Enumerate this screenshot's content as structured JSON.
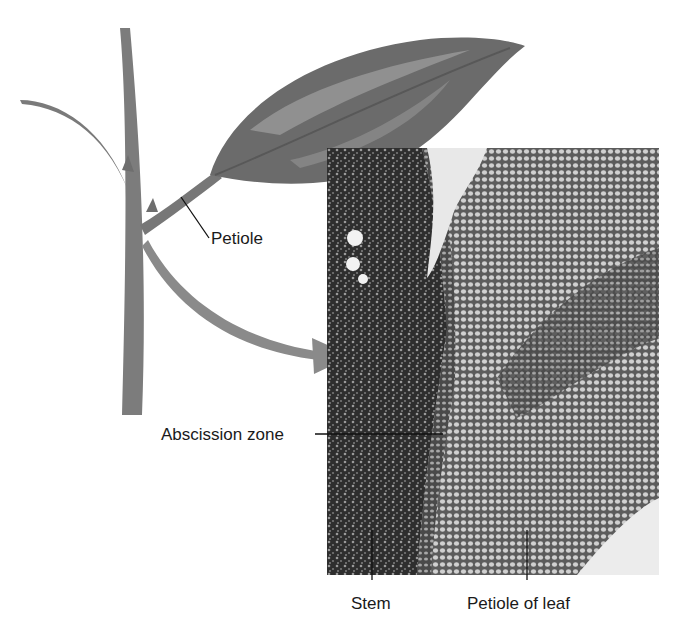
{
  "figure": {
    "labels": {
      "petiole": "Petiole",
      "abscission_zone": "Abscission zone",
      "stem": "Stem",
      "petiole_of_leaf": "Petiole of leaf"
    },
    "colors": {
      "stem": "#7a7a7a",
      "leaf_dark": "#6b6b6b",
      "leaf_light": "#9a9a9a",
      "arrow": "#8a8a8a",
      "micro_dark": "#2a2a2a",
      "micro_light": "#bdbdbd"
    }
  }
}
